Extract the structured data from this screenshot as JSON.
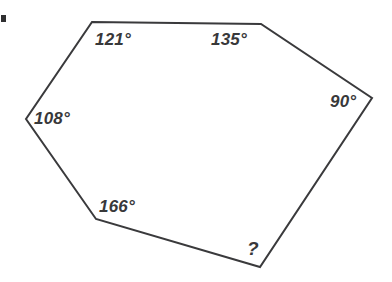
{
  "figure": {
    "shape_name": "hexagon",
    "stroke_color": "#3a3a3c",
    "fill_color": "#ffffff",
    "background_color": "#ffffff",
    "text_color": "#38383a",
    "stroke_width": 2,
    "width": 392,
    "height": 282,
    "vertices": [
      {
        "name": "top-left",
        "x": 92,
        "y": 22
      },
      {
        "name": "top-right",
        "x": 261,
        "y": 24
      },
      {
        "name": "right",
        "x": 372,
        "y": 98
      },
      {
        "name": "bottom-right",
        "x": 260,
        "y": 267
      },
      {
        "name": "bottom-left",
        "x": 96,
        "y": 219
      },
      {
        "name": "left",
        "x": 26,
        "y": 119
      }
    ],
    "angles": [
      {
        "id": "angle-top-left",
        "vertex": "top-left",
        "label": "121°",
        "value": 121,
        "known": true,
        "label_x": 95,
        "label_y": 31
      },
      {
        "id": "angle-top-right",
        "vertex": "top-right",
        "label": "135°",
        "value": 135,
        "known": true,
        "label_x": 211,
        "label_y": 31
      },
      {
        "id": "angle-right",
        "vertex": "right",
        "label": "90°",
        "value": 90,
        "known": true,
        "label_x": 330,
        "label_y": 93
      },
      {
        "id": "angle-bottom-right",
        "vertex": "bottom-right",
        "label": "?",
        "value": null,
        "known": false,
        "label_x": 247,
        "label_y": 239
      },
      {
        "id": "angle-bottom-left",
        "vertex": "bottom-left",
        "label": "166°",
        "value": 166,
        "known": true,
        "label_x": 99,
        "label_y": 198
      },
      {
        "id": "angle-left",
        "vertex": "left",
        "label": "108°",
        "value": 108,
        "known": true,
        "label_x": 34,
        "label_y": 110
      }
    ],
    "artifact": {
      "name": "scan-artifact",
      "x": 1,
      "y": 15,
      "width": 5,
      "height": 7
    }
  }
}
